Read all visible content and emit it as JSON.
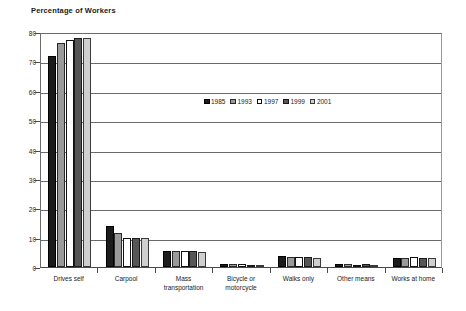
{
  "chart_data": {
    "type": "bar",
    "title": "Percentage of Workers",
    "xlabel": "",
    "ylabel": "",
    "ylim": [
      0,
      80
    ],
    "ytick_step": 10,
    "yticks": [
      "0",
      "10",
      "20",
      "30",
      "40",
      "50",
      "60",
      "70",
      "80"
    ],
    "grid": true,
    "legend_position": "center-upper",
    "categories": [
      "Drives self",
      "Carpool",
      "Mass transportation",
      "Bicycle or motorcycle",
      "Walks only",
      "Other means",
      "Works at home"
    ],
    "category_label_lines": [
      [
        "Drives self"
      ],
      [
        "Carpool"
      ],
      [
        "Mass",
        "transportation"
      ],
      [
        "Bicycle or",
        "motorcycle"
      ],
      [
        "Walks only"
      ],
      [
        "Other means"
      ],
      [
        "Works at home"
      ]
    ],
    "series": [
      {
        "name": "1985",
        "color": "#1c1c1c",
        "values": [
          72.0,
          14.0,
          5.5,
          1.0,
          3.9,
          0.9,
          3.0
        ]
      },
      {
        "name": "1993",
        "color": "#9a9a9a",
        "values": [
          76.2,
          11.5,
          5.3,
          0.9,
          3.5,
          0.9,
          3.0
        ]
      },
      {
        "name": "1997",
        "color": "#ffffff",
        "values": [
          77.4,
          10.0,
          5.5,
          0.9,
          3.4,
          0.8,
          3.3
        ]
      },
      {
        "name": "1999",
        "color": "#565656",
        "values": [
          78.0,
          10.0,
          5.3,
          0.8,
          3.4,
          1.0,
          3.1
        ]
      },
      {
        "name": "2001",
        "color": "#cfcfcf",
        "values": [
          78.1,
          10.0,
          5.2,
          0.7,
          3.2,
          0.8,
          3.2
        ]
      }
    ]
  }
}
